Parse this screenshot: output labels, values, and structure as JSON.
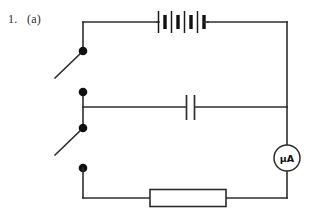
{
  "figure": {
    "label": "1.   (a)",
    "kind": "circuit-diagram",
    "background_color": "#ffffff",
    "wire_color": "#2e2e2e",
    "node_color": "#111111"
  },
  "components": {
    "battery": {
      "name": "battery",
      "symbol": "battery-cells",
      "cell_count": 4,
      "label": ""
    },
    "capacitor": {
      "name": "capacitor",
      "symbol": "parallel-plate-capacitor",
      "label": ""
    },
    "resistor": {
      "name": "resistor",
      "symbol": "resistor-box",
      "label": ""
    },
    "microammeter": {
      "name": "microammeter",
      "symbol": "meter-circle",
      "label": "μA"
    },
    "switch_top": {
      "name": "switch-top",
      "symbol": "open-switch",
      "state": "open",
      "label": ""
    },
    "switch_bottom": {
      "name": "switch-bottom",
      "symbol": "open-switch",
      "state": "open",
      "label": ""
    }
  },
  "nodes": [
    {
      "name": "node-switch-top-upper",
      "x": 83,
      "y": 51
    },
    {
      "name": "node-switch-top-lower",
      "x": 83,
      "y": 92
    },
    {
      "name": "node-switch-bottom-upper",
      "x": 83,
      "y": 128
    },
    {
      "name": "node-switch-bottom-lower",
      "x": 83,
      "y": 168
    }
  ]
}
